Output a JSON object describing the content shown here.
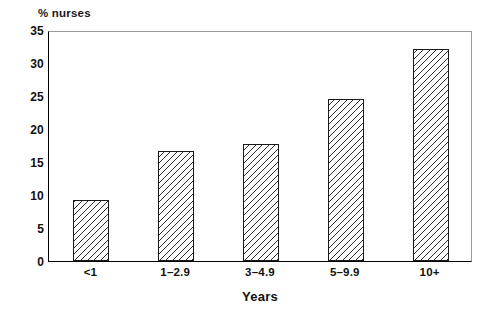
{
  "chart_data": {
    "type": "bar",
    "title": "",
    "subtitle": "",
    "xlabel": "Years",
    "ylabel": "% nurses",
    "categories": [
      "<1",
      "1–2.9",
      "3–4.9",
      "5–9.9",
      "10+"
    ],
    "values": [
      9.3,
      16.7,
      17.7,
      24.5,
      32.1
    ],
    "ylim": [
      0,
      35
    ],
    "ytick_values": [
      0,
      5,
      10,
      15,
      20,
      25,
      30,
      35
    ],
    "ytick_labels": [
      "0",
      "5",
      "10",
      "15",
      "20",
      "25",
      "30",
      "35"
    ],
    "grid": false,
    "legend": false,
    "legend_position": "none",
    "bar_fill": "#ffffff",
    "bar_hatch": "diagonal-lines",
    "bar_edge_color": "#1a1a1a",
    "axis_color": "#000000",
    "background_color": "#ffffff",
    "annotations": []
  },
  "axes": {
    "y_title": "% nurses",
    "x_title": "Years"
  }
}
